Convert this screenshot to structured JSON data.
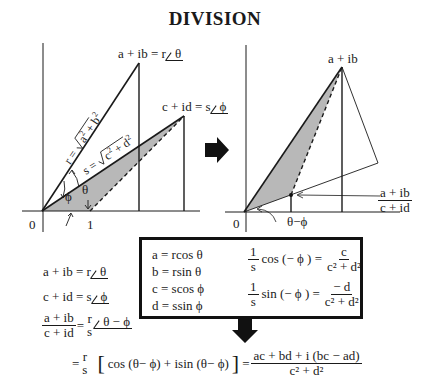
{
  "title": "DIVISION",
  "left_diagram": {
    "origin_label": "0",
    "unit_label": "1",
    "point_ab_label": "a + ib = r",
    "point_ab_angle": "θ",
    "point_cd_label": "c + id = s",
    "point_cd_angle": "ϕ",
    "r_label": "r = √(a² + b²)",
    "s_label": "s = √(c² + d²)",
    "theta_label": "θ",
    "phi_label": "ϕ"
  },
  "right_diagram": {
    "origin_label": "0",
    "point_ab_label": "a + ib",
    "quotient_num": "a + ib",
    "quotient_den": "c + id",
    "angle_label": "θ−ϕ"
  },
  "equations_left": [
    {
      "lhs": "a + ib = r",
      "angle": "θ"
    },
    {
      "lhs": "c + id = s",
      "angle": "ϕ"
    },
    {
      "num": "a + ib",
      "den": "c + id",
      "eq": "=",
      "coef_num": "r",
      "coef_den": "s",
      "angle": "θ − ϕ"
    }
  ],
  "box": {
    "defs": [
      "a  =  rcos θ",
      "b  =  rsin θ",
      "c  =  scos ϕ",
      "d  =  ssin ϕ"
    ],
    "identity_cos": {
      "coef_num": "1",
      "coef_den": "s",
      "func": "cos (− ϕ ) =",
      "num": "c",
      "den": "c² + d²"
    },
    "identity_sin": {
      "coef_num": "1",
      "coef_den": "s",
      "func": "sin (− ϕ ) =",
      "num": "− d",
      "den": "c² + d²"
    }
  },
  "final_equation": {
    "eq1": "=",
    "coef_num": "r",
    "coef_den": "s",
    "bracket_content": "cos (θ− ϕ) + isin (θ− ϕ)",
    "eq2": "=",
    "num": "ac + bd + i (bc − ad)",
    "den": "c² + d²"
  },
  "colors": {
    "shade": "#b8b8b8",
    "ink": "#1a1a1a"
  }
}
